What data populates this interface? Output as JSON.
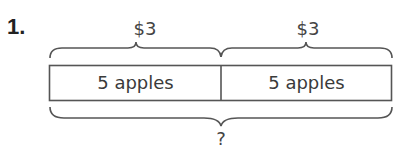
{
  "problem_number": "1.",
  "top_labels": [
    "$3",
    "$3"
  ],
  "tape": {
    "cells": [
      {
        "label": "5 apples"
      },
      {
        "label": "5 apples"
      }
    ]
  },
  "total_label": "?",
  "colors": {
    "stroke": "#555555",
    "text": "#3a3a3a"
  }
}
